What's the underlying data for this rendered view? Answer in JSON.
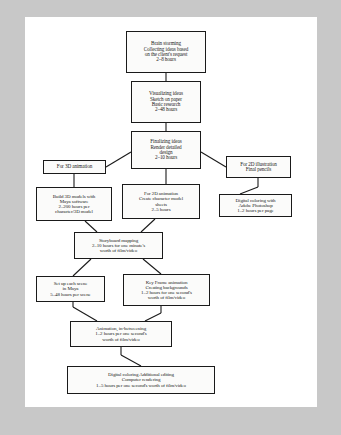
{
  "diagram": {
    "page_background": "#ffffff",
    "canvas_background": "#c8c8c8",
    "line_color": "#1a1a1a",
    "nodes": [
      {
        "id": "brainstorm",
        "lines": [
          "Brain storming",
          "Collecting ideas based",
          "on the client's request",
          "2–8 hours"
        ]
      },
      {
        "id": "visualizing",
        "lines": [
          "Visualizing ideas",
          "Sketch on paper",
          "Basic research",
          "2–48 hours"
        ]
      },
      {
        "id": "finalizing",
        "lines": [
          "Finalizing ideas",
          "Render detailed",
          "design",
          "2–10 hours"
        ]
      },
      {
        "id": "for_3d_animation",
        "lines": [
          "For 3D animation"
        ]
      },
      {
        "id": "for_2d_illustration",
        "lines": [
          "For 2D illustration",
          "Final pencils"
        ]
      },
      {
        "id": "build_3d_models",
        "lines": [
          "Build 3D models with",
          "Maya software",
          "2–200 hours per",
          "character/3D model"
        ]
      },
      {
        "id": "for_2d_animation",
        "lines": [
          "For 2D animation",
          "Create character model",
          "sheets",
          "2–5 hours"
        ]
      },
      {
        "id": "digital_coloring_photoshop",
        "lines": [
          "Digital coloring with",
          "Adobe Photoshop",
          "1–2 hours per page"
        ]
      },
      {
        "id": "storyboard_mapping",
        "lines": [
          "Storyboard mapping",
          "2–10 hours for one minute's",
          "worth of film/video"
        ]
      },
      {
        "id": "set_up_each_scene",
        "lines": [
          "Set up each scene",
          "in Maya",
          "5–48 hours per scene"
        ]
      },
      {
        "id": "key_frame_animation",
        "lines": [
          "Key Frame animation",
          "Creating backgrounds",
          "1–2 hours for one second's",
          "worth of film/video"
        ]
      },
      {
        "id": "animation_in_betweening",
        "lines": [
          "Animation, in-betweening",
          "1–2 hours per one second's",
          "worth of film/video"
        ]
      },
      {
        "id": "digital_coloring_final",
        "lines": [
          "Digital coloring Additional editing",
          "Computer rendering",
          "1–5 hours per one second's worth of film/video"
        ]
      }
    ]
  }
}
